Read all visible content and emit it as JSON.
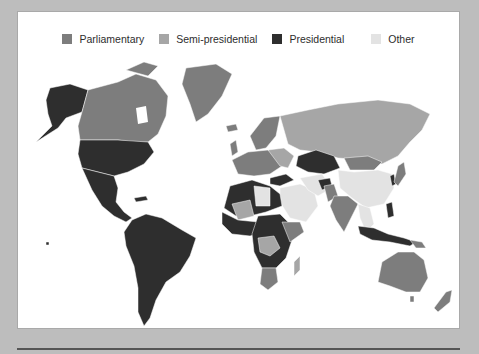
{
  "legend": {
    "items": [
      {
        "label": "Parliamentary",
        "color": "#7d7d7d"
      },
      {
        "label": "Semi-presidential",
        "color": "#a6a6a6"
      },
      {
        "label": "Presidential",
        "color": "#2e2e2e"
      },
      {
        "label": "Other",
        "color": "#e3e3e3"
      }
    ]
  },
  "map": {
    "title": "World map of systems of government",
    "regions": [
      {
        "name": "Alaska / United States",
        "category": "Presidential"
      },
      {
        "name": "Canada",
        "category": "Parliamentary"
      },
      {
        "name": "Greenland",
        "category": "Parliamentary"
      },
      {
        "name": "Mexico & Central America",
        "category": "Presidential"
      },
      {
        "name": "South America",
        "category": "Presidential"
      },
      {
        "name": "Western Europe",
        "category": "Parliamentary"
      },
      {
        "name": "Russia",
        "category": "Semi-presidential"
      },
      {
        "name": "Kazakhstan",
        "category": "Presidential"
      },
      {
        "name": "Turkey",
        "category": "Presidential"
      },
      {
        "name": "China",
        "category": "Other"
      },
      {
        "name": "Middle East",
        "category": "Other"
      },
      {
        "name": "India",
        "category": "Parliamentary"
      },
      {
        "name": "Africa (most)",
        "category": "Presidential"
      },
      {
        "name": "DR Congo",
        "category": "Semi-presidential"
      },
      {
        "name": "Southern Africa",
        "category": "Parliamentary"
      },
      {
        "name": "Indonesia",
        "category": "Presidential"
      },
      {
        "name": "Japan",
        "category": "Parliamentary"
      },
      {
        "name": "Australia",
        "category": "Parliamentary"
      },
      {
        "name": "New Zealand",
        "category": "Parliamentary"
      }
    ]
  }
}
